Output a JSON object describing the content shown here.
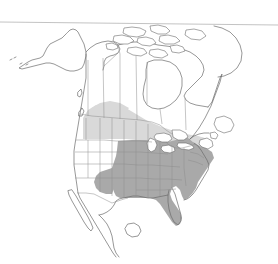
{
  "figure": {
    "kind": "distribution-map",
    "region": "North America",
    "background_color": "#ffffff",
    "width": 278,
    "height": 264
  },
  "rule": {
    "name": "top-horizontal-rule",
    "color": "#b4b4b4",
    "y_left": 22,
    "y_right": 25
  },
  "shading": {
    "core": {
      "label": "",
      "color": "#a9a9a9",
      "description": "eastern and central United States"
    },
    "margin": {
      "label": "",
      "color": "#d9d9d9",
      "description": "southern Canada band"
    },
    "unshaded": {
      "label": "",
      "color": "#ffffff",
      "description": "western United States, Mexico, northern Canada, Alaska"
    }
  },
  "outlines": {
    "coast_color": "#6b6b6b",
    "subdivision_color": "#8d8d8d",
    "lake_color": "#ffffff"
  },
  "landmasses": [
    {
      "name": "alaska"
    },
    {
      "name": "canada-mainland"
    },
    {
      "name": "arctic-archipelago"
    },
    {
      "name": "greenland-edge"
    },
    {
      "name": "united-states"
    },
    {
      "name": "mexico"
    },
    {
      "name": "baja-california"
    },
    {
      "name": "newfoundland"
    },
    {
      "name": "great-lakes"
    },
    {
      "name": "florida-peninsula"
    }
  ]
}
